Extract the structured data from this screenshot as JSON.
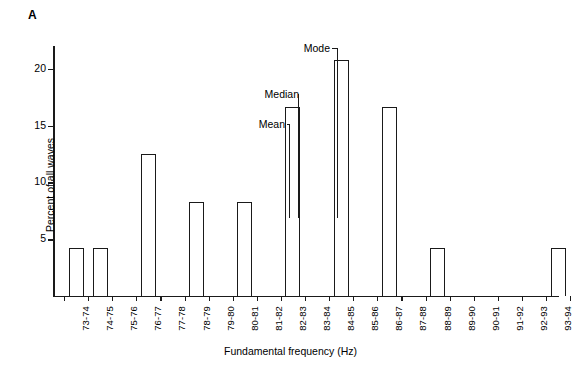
{
  "panel": {
    "label": "A"
  },
  "chart_data": {
    "type": "bar",
    "title": "",
    "xlabel": "Fundamental frequency (Hz)",
    "ylabel": "Percent of all waves",
    "ylim": [
      0,
      22
    ],
    "yticks": [
      5,
      10,
      15,
      20
    ],
    "ytick_labels": [
      "5",
      "10",
      "15",
      "20"
    ],
    "grid": false,
    "legend": "none",
    "categories": [
      "73-74",
      "74-75",
      "75-76",
      "76-77",
      "77-78",
      "78-79",
      "79-80",
      "80-81",
      "81-82",
      "82-83",
      "83-84",
      "84-85",
      "85-86",
      "86-87",
      "87-88",
      "88-89",
      "89-90",
      "90-91",
      "91-92",
      "92-93",
      "93-94"
    ],
    "values": [
      4.2,
      4.2,
      0,
      12.5,
      0,
      8.3,
      0,
      8.3,
      0,
      16.6,
      0,
      20.8,
      0,
      16.6,
      0,
      4.2,
      0,
      0,
      0,
      0,
      4.2
    ],
    "bar_style": {
      "fill": "#ffffff",
      "edge": "#1a1a1a"
    },
    "annotations": [
      {
        "text": "Mean",
        "category": "82-83",
        "value": 16.6
      },
      {
        "text": "Median",
        "category": "82-83",
        "value": 16.6
      },
      {
        "text": "Mode",
        "category": "84-85",
        "value": 20.8
      }
    ]
  }
}
